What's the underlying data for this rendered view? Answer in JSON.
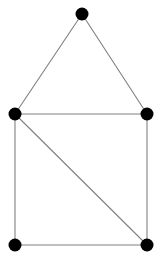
{
  "figure": {
    "kind": "undirected-graph-drawing",
    "width": 164,
    "height": 262,
    "background_color": "#ffffff",
    "node_color": "#000000",
    "node_radius": 6.5,
    "edge_color": "#808080",
    "edge_width": 1.1
  },
  "graph": {
    "node_count": 5,
    "edge_count": 7,
    "nodes": [
      {
        "id": "apex",
        "x": 82,
        "y": 14
      },
      {
        "id": "left-mid",
        "x": 15,
        "y": 114
      },
      {
        "id": "right-mid",
        "x": 147,
        "y": 114
      },
      {
        "id": "bottom-left",
        "x": 15,
        "y": 245
      },
      {
        "id": "bottom-right",
        "x": 147,
        "y": 245
      }
    ],
    "edges": [
      {
        "id": "apex-left",
        "from": "apex",
        "to": "left-mid",
        "x1": 82,
        "y1": 14,
        "x2": 15,
        "y2": 114
      },
      {
        "id": "apex-right",
        "from": "apex",
        "to": "right-mid",
        "x1": 82,
        "y1": 14,
        "x2": 147,
        "y2": 114
      },
      {
        "id": "mid-horizontal",
        "from": "left-mid",
        "to": "right-mid",
        "x1": 15,
        "y1": 114,
        "x2": 147,
        "y2": 114
      },
      {
        "id": "left-vertical",
        "from": "left-mid",
        "to": "bottom-left",
        "x1": 15,
        "y1": 114,
        "x2": 15,
        "y2": 245
      },
      {
        "id": "right-vertical",
        "from": "right-mid",
        "to": "bottom-right",
        "x1": 147,
        "y1": 114,
        "x2": 147,
        "y2": 245
      },
      {
        "id": "bottom-horizontal",
        "from": "bottom-left",
        "to": "bottom-right",
        "x1": 15,
        "y1": 245,
        "x2": 147,
        "y2": 245
      },
      {
        "id": "diagonal",
        "from": "left-mid",
        "to": "bottom-right",
        "x1": 15,
        "y1": 114,
        "x2": 147,
        "y2": 245
      }
    ]
  }
}
